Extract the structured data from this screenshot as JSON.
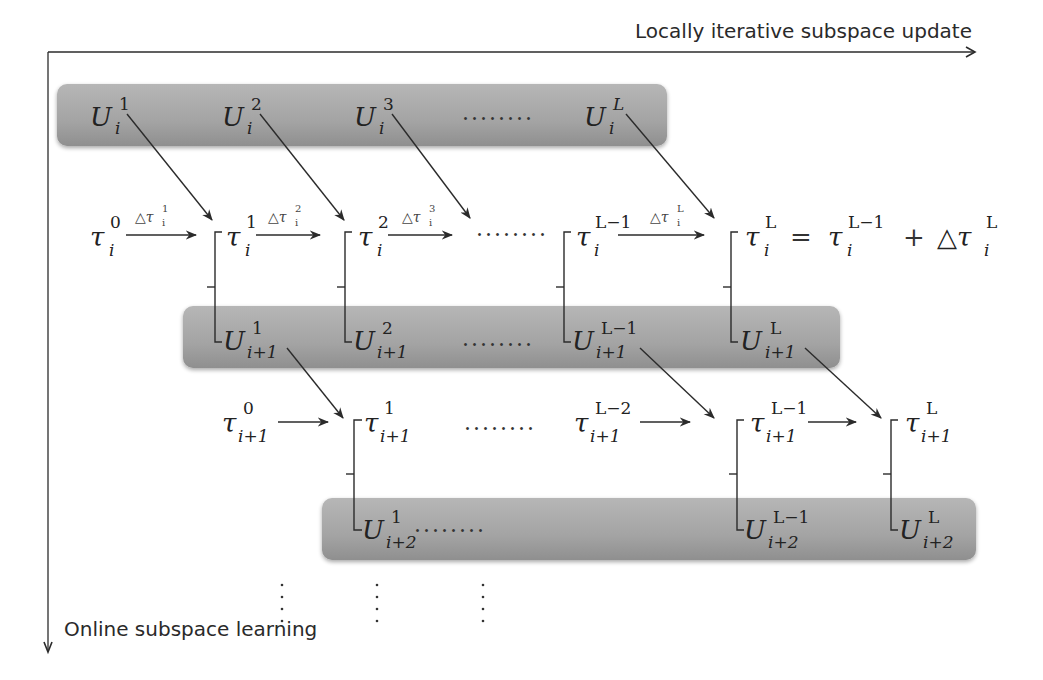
{
  "axes": {
    "horizontal_label": "Locally iterative subspace update",
    "vertical_label": "Online subspace learning"
  },
  "colors": {
    "band_fill": "#a9a9a9",
    "band_shadow": "#8c8c8c",
    "line": "#2b2b2b",
    "text": "#222222"
  },
  "row_i": {
    "band": [
      "U_i^1",
      "U_i^2",
      "U_i^3",
      "........",
      "U_i^L"
    ],
    "U": [
      {
        "base": "U",
        "sup": "1",
        "sub": "i"
      },
      {
        "base": "U",
        "sup": "2",
        "sub": "i"
      },
      {
        "base": "U",
        "sup": "3",
        "sub": "i"
      },
      {
        "base": "U",
        "sup": "L",
        "sub": "i"
      }
    ],
    "ellipsis": "........",
    "tau": [
      {
        "base": "τ",
        "sup": "0",
        "sub": "i"
      },
      {
        "base": "τ",
        "sup": "1",
        "sub": "i"
      },
      {
        "base": "τ",
        "sup": "2",
        "sub": "i"
      },
      {
        "base": "τ",
        "sup": "L−1",
        "sub": "i"
      },
      {
        "base": "τ",
        "sup": "L",
        "sub": "i"
      }
    ],
    "deltas": [
      {
        "delta": "△τ",
        "sup": "1",
        "sub": "i"
      },
      {
        "delta": "△τ",
        "sup": "2",
        "sub": "i"
      },
      {
        "delta": "△τ",
        "sup": "3",
        "sub": "i"
      },
      {
        "delta": "△τ",
        "sup": "L",
        "sub": "i"
      }
    ],
    "equation": {
      "lhs": "τ_i^L",
      "eq": "=",
      "rhs1": {
        "base": "τ",
        "sup": "L−1",
        "sub": "i"
      },
      "plus": "+",
      "rhs2": {
        "base": "△τ",
        "sup": "L",
        "sub": "i"
      }
    }
  },
  "row_i1": {
    "U": [
      {
        "base": "U",
        "sup": "1",
        "sub": "i+1"
      },
      {
        "base": "U",
        "sup": "2",
        "sub": "i+1"
      },
      {
        "base": "U",
        "sup": "L−1",
        "sub": "i+1"
      },
      {
        "base": "U",
        "sup": "L",
        "sub": "i+1"
      }
    ],
    "ellipsis": "........",
    "tau": [
      {
        "base": "τ",
        "sup": "0",
        "sub": "i+1"
      },
      {
        "base": "τ",
        "sup": "1",
        "sub": "i+1"
      },
      {
        "base": "τ",
        "sup": "L−2",
        "sub": "i+1"
      },
      {
        "base": "τ",
        "sup": "L−1",
        "sub": "i+1"
      },
      {
        "base": "τ",
        "sup": "L",
        "sub": "i+1"
      }
    ],
    "tau_ellipsis": "........"
  },
  "row_i2": {
    "U": [
      {
        "base": "U",
        "sup": "1",
        "sub": "i+2"
      },
      {
        "base": "U",
        "sup": "L−1",
        "sub": "i+2"
      },
      {
        "base": "U",
        "sup": "L",
        "sub": "i+2"
      }
    ],
    "ellipsis": "........"
  },
  "vertical_dots": "⋮"
}
